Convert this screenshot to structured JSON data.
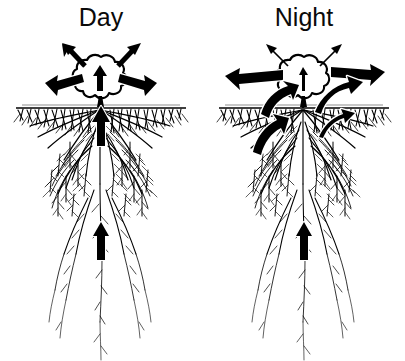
{
  "figure": {
    "title_left": "Day",
    "title_right": "Night",
    "background_color": "#ffffff",
    "ink_color": "#000000",
    "highlight_color": "#ffffff"
  },
  "panels": [
    {
      "id": "day",
      "label": "Day",
      "canopy": {
        "transpiration_arrows": 2,
        "transpiration_weight": "thick",
        "stem_arrow_direction": "up",
        "stem_arrow_weight": "thick"
      },
      "soil": {
        "surface_line": true,
        "shallow_root_mat": true
      },
      "flux_arrows": [
        {
          "name": "shallow-left-uptake",
          "direction": "inward-left",
          "style": "outlined-black",
          "region": "shallow-left"
        },
        {
          "name": "shallow-right-uptake",
          "direction": "inward-right",
          "style": "outlined-black",
          "region": "shallow-right"
        },
        {
          "name": "taproot-upper-flow",
          "direction": "up",
          "style": "solid-black",
          "region": "taproot-upper"
        },
        {
          "name": "taproot-deep-flow",
          "direction": "up",
          "style": "solid-black",
          "region": "taproot-deep"
        }
      ]
    },
    {
      "id": "night",
      "label": "Night",
      "canopy": {
        "transpiration_arrows": 2,
        "transpiration_weight": "thin",
        "stem_arrow_direction": "up",
        "stem_arrow_weight": "thin"
      },
      "soil": {
        "surface_line": true,
        "shallow_root_mat": true
      },
      "flux_arrows": [
        {
          "name": "surface-left-efflux",
          "direction": "outward-left",
          "style": "outlined-black",
          "region": "surface-left"
        },
        {
          "name": "surface-right-efflux",
          "direction": "outward-right",
          "style": "outlined-black",
          "region": "surface-right"
        },
        {
          "name": "upper-left-efflux",
          "direction": "outward-left-down",
          "style": "outlined-black",
          "region": "upper-left"
        },
        {
          "name": "upper-right-efflux",
          "direction": "outward-right-up",
          "style": "outlined-black",
          "region": "upper-right"
        },
        {
          "name": "mid-left-efflux",
          "direction": "outward-left-down",
          "style": "outlined-black",
          "region": "mid-left"
        },
        {
          "name": "mid-right-efflux",
          "direction": "outward-right-up",
          "style": "outlined-black",
          "region": "mid-right"
        },
        {
          "name": "taproot-deep-flow",
          "direction": "up",
          "style": "solid-black",
          "region": "taproot-deep"
        }
      ]
    }
  ]
}
